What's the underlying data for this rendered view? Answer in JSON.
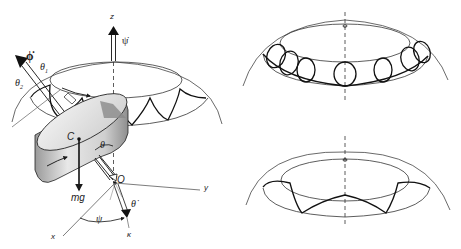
{
  "figure": {
    "colors": {
      "line": "#1a1a1a",
      "thin_line": "#444444",
      "disk_light": "#e6e6e6",
      "disk_mid": "#bdbdbd",
      "disk_dark": "#8a8a8a",
      "background": "#ffffff"
    },
    "left_panel": {
      "labels": {
        "z_axis": "z",
        "psi_dot": "ψ̇",
        "phi_dot": "ϕ̇",
        "theta1": "θ",
        "theta1_sub": "1",
        "theta2": "θ",
        "theta2_sub": "2",
        "center_of_mass": "C",
        "weight": "mg",
        "theta": "θ",
        "origin": "O",
        "y_axis": "y",
        "x_axis": "x",
        "psi": "ψ",
        "theta_dot": "θ̇",
        "kappa": "κ"
      }
    },
    "right_top_panel": {
      "locus_type": "looping nutation",
      "loop_count": 8
    },
    "right_bottom_panel": {
      "locus_type": "wavy nutation",
      "arc_count": 4
    }
  }
}
